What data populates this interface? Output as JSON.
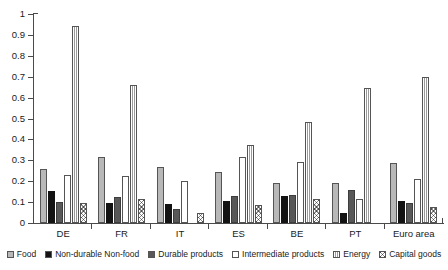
{
  "chart_data": {
    "type": "bar",
    "title": "",
    "subtitle": "",
    "xlabel": "",
    "ylabel": "",
    "ylim": [
      0,
      1
    ],
    "yticks": [
      "0",
      "0.1",
      "0.2",
      "0.3",
      "0.4",
      "0.5",
      "0.6",
      "0.7",
      "0.8",
      "0.9",
      "1"
    ],
    "ytick_values": [
      0,
      0.1,
      0.2,
      0.3,
      0.4,
      0.5,
      0.6,
      0.7,
      0.8,
      0.9,
      1
    ],
    "grid": false,
    "legend_position": "bottom",
    "categories": [
      "DE",
      "FR",
      "IT",
      "ES",
      "BE",
      "PT",
      "Euro area"
    ],
    "series": [
      {
        "name": "Food",
        "pattern": "light-grey-solid",
        "color": "#b8b8b8",
        "values": [
          0.26,
          0.315,
          0.27,
          0.245,
          0.19,
          0.19,
          0.285
        ]
      },
      {
        "name": "Non-durable Non-food",
        "pattern": "black-solid",
        "color": "#131313",
        "values": [
          0.155,
          0.095,
          0.09,
          0.105,
          0.13,
          0.05,
          0.105
        ]
      },
      {
        "name": "Durable products",
        "pattern": "dark-grey-solid",
        "color": "#585858",
        "values": [
          0.1,
          0.125,
          0.065,
          0.13,
          0.135,
          0.16,
          0.095
        ]
      },
      {
        "name": "Intermediate products",
        "pattern": "white-outline",
        "color": "#ffffff",
        "values": [
          0.23,
          0.225,
          0.2,
          0.315,
          0.29,
          0.115,
          0.21
        ]
      },
      {
        "name": "Energy",
        "pattern": "vertical-stripes",
        "color": "#9a9a9a",
        "values": [
          0.945,
          0.66,
          0.0,
          0.375,
          0.485,
          0.645,
          0.7
        ]
      },
      {
        "name": "Capital goods",
        "pattern": "cross-hatch",
        "color": "#8d8d8d",
        "values": [
          0.095,
          0.115,
          0.05,
          0.085,
          0.115,
          0.0,
          0.075
        ]
      }
    ]
  },
  "legend": {
    "items": [
      {
        "label": "Food",
        "pattern": "p-food"
      },
      {
        "label": "Non-durable Non-food",
        "pattern": "p-nondur"
      },
      {
        "label": "Durable products",
        "pattern": "p-dur"
      },
      {
        "label": "Intermediate products",
        "pattern": "p-inter"
      },
      {
        "label": "Energy",
        "pattern": "p-energy"
      },
      {
        "label": "Capital goods",
        "pattern": "p-capital"
      }
    ]
  }
}
